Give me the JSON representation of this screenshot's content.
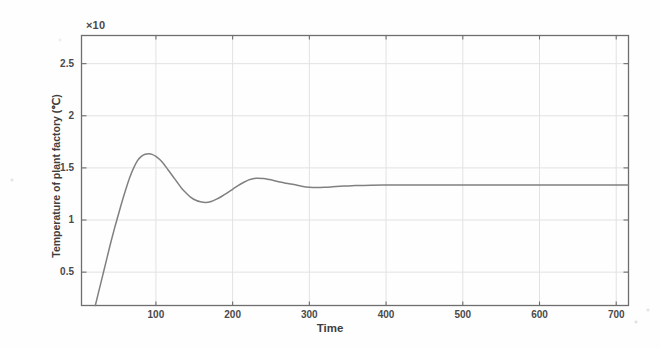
{
  "figure": {
    "background_color": "#fefefe",
    "frame_color": "#6e6e6e",
    "grid_color": "#e2e2e2",
    "curve_color": "#808080",
    "exponent_label": "×10"
  },
  "chart_data": {
    "type": "line",
    "title": "",
    "subtitle": "",
    "xlabel": "Time",
    "ylabel": "Temperature of plant factory (℃)",
    "y_axis_exponent_label": "×10",
    "xlim": [
      3,
      716
    ],
    "ylim": [
      0.18,
      2.77
    ],
    "xticks": [
      100,
      200,
      300,
      400,
      500,
      600,
      700
    ],
    "xticklabels": [
      "100",
      "200",
      "300",
      "400",
      "500",
      "600",
      "700"
    ],
    "yticks": [
      0.5,
      1,
      1.5,
      2,
      2.5
    ],
    "yticklabels": [
      "0.5",
      "1",
      "1.5",
      "2",
      "2.5"
    ],
    "grid": true,
    "legend": null,
    "series": [
      {
        "name": "plant factory temperature step response",
        "color": "#808080",
        "linewidth": 1.5,
        "annotations": {
          "steady_state_value": 1.335,
          "first_peak": {
            "x": 95,
            "y": 1.63
          },
          "first_trough": {
            "x": 165,
            "y": 1.17
          },
          "second_peak": {
            "x": 232,
            "y": 1.4
          },
          "second_trough": {
            "x": 300,
            "y": 1.31
          },
          "rise_start_x": 21
        },
        "x": [
          21,
          26,
          31,
          36,
          41,
          46,
          51,
          56,
          61,
          66,
          71,
          76,
          81,
          86,
          91,
          95,
          100,
          105,
          110,
          116,
          122,
          128,
          134,
          140,
          146,
          152,
          158,
          165,
          172,
          179,
          186,
          193,
          200,
          207,
          214,
          221,
          228,
          232,
          240,
          248,
          256,
          264,
          272,
          280,
          290,
          300,
          310,
          320,
          330,
          340,
          350,
          360,
          380,
          400,
          430,
          460,
          500,
          550,
          600,
          650,
          700,
          716
        ],
        "y": [
          0.18,
          0.33,
          0.48,
          0.63,
          0.78,
          0.92,
          1.05,
          1.18,
          1.3,
          1.41,
          1.5,
          1.57,
          1.61,
          1.631,
          1.636,
          1.63,
          1.61,
          1.58,
          1.54,
          1.48,
          1.42,
          1.36,
          1.3,
          1.255,
          1.215,
          1.19,
          1.175,
          1.168,
          1.178,
          1.2,
          1.228,
          1.26,
          1.295,
          1.33,
          1.36,
          1.385,
          1.398,
          1.4,
          1.398,
          1.388,
          1.375,
          1.362,
          1.35,
          1.34,
          1.325,
          1.315,
          1.312,
          1.314,
          1.318,
          1.323,
          1.327,
          1.33,
          1.334,
          1.335,
          1.335,
          1.335,
          1.335,
          1.335,
          1.335,
          1.335,
          1.335,
          1.335
        ]
      }
    ]
  }
}
